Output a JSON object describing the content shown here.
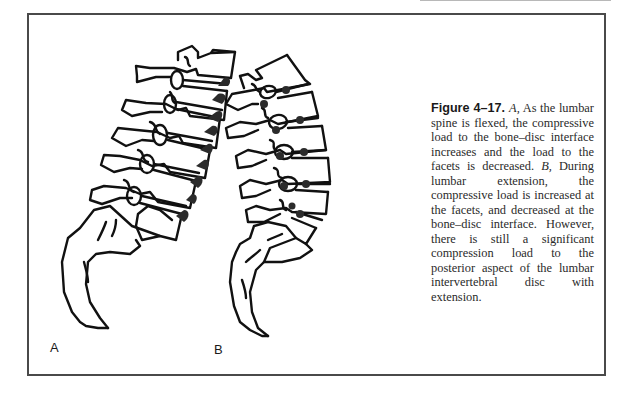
{
  "figure": {
    "number": "Figure 4–17.",
    "panels": [
      {
        "label": "A",
        "description": "Lumbar spine in flexion; compressive load shaded at anterior bone–disc interface"
      },
      {
        "label": "B",
        "description": "Lumbar spine in extension; compressive load shaded at facets and posterior disc"
      }
    ],
    "caption": {
      "seg1_marker": "A,",
      "seg1_text": " As the lumbar spine is flexed, the compressive load to the bone–disc interface increases and the load to the facets is decreased. ",
      "seg2_marker": "B,",
      "seg2_text": " During lumbar extension, the compressive load is increased at the facets, and decreased at the bone–disc inter­face. However, there is still a sig­nificant compression load to the posterior aspect of the lumbar intervertebral disc with extension."
    }
  },
  "colors": {
    "frame": "#4a4a4a",
    "ink": "#111111",
    "load_shading": "#2b2b2b",
    "caption_text": "#2a2a2a"
  }
}
